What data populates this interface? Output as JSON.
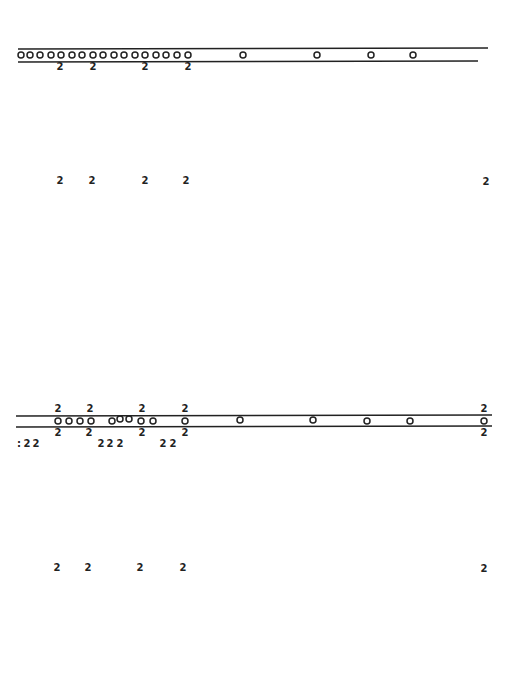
{
  "figure": {
    "background": "#ffffff",
    "ink": "#222222",
    "label_text": "2",
    "panels": [
      {
        "name": "top-track",
        "rails": [
          {
            "x1": 18,
            "y1": 49,
            "x2": 488,
            "y2": 48
          },
          {
            "x1": 18,
            "y1": 62,
            "x2": 478,
            "y2": 61
          }
        ],
        "circles_y": 55,
        "circles_x": [
          21,
          30,
          40,
          51,
          61,
          72,
          82,
          93,
          103,
          114,
          124,
          135,
          145,
          156,
          166,
          177,
          188,
          243,
          317,
          371,
          413
        ],
        "labels": [
          {
            "x": 60,
            "y": 67,
            "text": "2"
          },
          {
            "x": 93,
            "y": 67,
            "text": "2"
          },
          {
            "x": 145,
            "y": 67,
            "text": "2"
          },
          {
            "x": 188,
            "y": 67,
            "text": "2"
          }
        ]
      },
      {
        "name": "top-projection",
        "labels": [
          {
            "x": 60,
            "y": 181,
            "text": "2"
          },
          {
            "x": 92,
            "y": 181,
            "text": "2"
          },
          {
            "x": 145,
            "y": 181,
            "text": "2"
          },
          {
            "x": 186,
            "y": 181,
            "text": "2"
          },
          {
            "x": 486,
            "y": 182,
            "text": "2"
          }
        ]
      },
      {
        "name": "bottom-track",
        "rails": [
          {
            "x1": 16,
            "y1": 416,
            "x2": 492,
            "y2": 415
          },
          {
            "x1": 16,
            "y1": 427,
            "x2": 492,
            "y2": 426
          }
        ],
        "circles": [
          {
            "x": 58,
            "y": 421
          },
          {
            "x": 69,
            "y": 421
          },
          {
            "x": 80,
            "y": 421
          },
          {
            "x": 91,
            "y": 421
          },
          {
            "x": 112,
            "y": 421
          },
          {
            "x": 120,
            "y": 419
          },
          {
            "x": 129,
            "y": 419
          },
          {
            "x": 141,
            "y": 421
          },
          {
            "x": 153,
            "y": 421
          },
          {
            "x": 185,
            "y": 421
          },
          {
            "x": 240,
            "y": 420
          },
          {
            "x": 313,
            "y": 420
          },
          {
            "x": 367,
            "y": 421
          },
          {
            "x": 410,
            "y": 421
          },
          {
            "x": 484,
            "y": 421
          }
        ],
        "labels_above": [
          {
            "x": 58,
            "y": 409,
            "text": "2"
          },
          {
            "x": 90,
            "y": 409,
            "text": "2"
          },
          {
            "x": 142,
            "y": 409,
            "text": "2"
          },
          {
            "x": 185,
            "y": 409,
            "text": "2"
          },
          {
            "x": 484,
            "y": 409,
            "text": "2"
          }
        ],
        "labels_below": [
          {
            "x": 58,
            "y": 433,
            "text": "2"
          },
          {
            "x": 89,
            "y": 433,
            "text": "2"
          },
          {
            "x": 142,
            "y": 433,
            "text": "2"
          },
          {
            "x": 185,
            "y": 433,
            "text": "2"
          },
          {
            "x": 484,
            "y": 433,
            "text": "2"
          }
        ],
        "labels_lower_row": [
          {
            "x": 27,
            "y": 444,
            "text": "2"
          },
          {
            "x": 36,
            "y": 444,
            "text": "2"
          },
          {
            "x": 101,
            "y": 444,
            "text": "2"
          },
          {
            "x": 110,
            "y": 444,
            "text": "2"
          },
          {
            "x": 120,
            "y": 444,
            "text": "2"
          },
          {
            "x": 163,
            "y": 444,
            "text": "2"
          },
          {
            "x": 173,
            "y": 444,
            "text": "2"
          }
        ],
        "edge_marks": [
          {
            "x": 19,
            "y": 444,
            "text": ":"
          }
        ]
      },
      {
        "name": "bottom-projection",
        "labels": [
          {
            "x": 57,
            "y": 568,
            "text": "2"
          },
          {
            "x": 88,
            "y": 568,
            "text": "2"
          },
          {
            "x": 140,
            "y": 568,
            "text": "2"
          },
          {
            "x": 183,
            "y": 568,
            "text": "2"
          },
          {
            "x": 484,
            "y": 569,
            "text": "2"
          }
        ]
      }
    ]
  }
}
